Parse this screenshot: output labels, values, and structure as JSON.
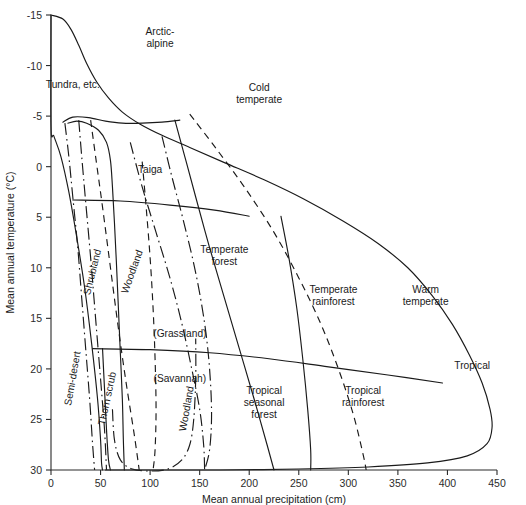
{
  "figure": {
    "line_color": "#1a1a1a",
    "background": "#ffffff"
  },
  "chart_data": {
    "type": "line",
    "title": "",
    "xlabel": "Mean annual precipitation (cm)",
    "ylabel": "Mean annual temperature (°C)",
    "xlim": [
      0,
      450
    ],
    "ylim_top": -15,
    "ylim_bottom": 30,
    "y_inverted": true,
    "grid": false,
    "legend": "none",
    "xticks": [
      0,
      50,
      100,
      150,
      200,
      250,
      300,
      350,
      400,
      450
    ],
    "xticklabels": [
      "0",
      "50",
      "100",
      "150",
      "200",
      "250",
      "300",
      "350",
      "400",
      "450"
    ],
    "yticks": [
      -15,
      -10,
      -5,
      0,
      5,
      10,
      15,
      20,
      25,
      30
    ],
    "yticklabels": [
      "-15",
      "-10",
      "-5",
      "0",
      "5",
      "10",
      "15",
      "20",
      "25",
      "30"
    ],
    "annotations": [
      {
        "text": "Arctic-alpine",
        "x": 110,
        "y": -13.0
      },
      {
        "text": "Tundra, etc.",
        "x": 22,
        "y": -7.8
      },
      {
        "text": "Taiga",
        "x": 100,
        "y": 0.6
      },
      {
        "text": "Cold temperate",
        "x": 210,
        "y": -7.5
      },
      {
        "text": "Shrubland",
        "x": 45,
        "y": 10.5,
        "rotation": -76
      },
      {
        "text": "Woodland",
        "x": 85,
        "y": 10.5,
        "rotation": -70
      },
      {
        "text": "Temperate forest",
        "x": 175,
        "y": 8.5
      },
      {
        "text": "(Grassland)",
        "x": 130,
        "y": 16.8
      },
      {
        "text": "(Savannah)",
        "x": 130,
        "y": 21.3
      },
      {
        "text": "Semi-desert",
        "x": 25,
        "y": 21.0,
        "rotation": -80
      },
      {
        "text": "Thorn scrub",
        "x": 60,
        "y": 23.0,
        "rotation": -78
      },
      {
        "text": "Woodland",
        "x": 140,
        "y": 24.0,
        "rotation": -80
      },
      {
        "text": "Temperate rainforest",
        "x": 285,
        "y": 12.5
      },
      {
        "text": "Warm temperate",
        "x": 378,
        "y": 12.5
      },
      {
        "text": "Tropical seasonal forest",
        "x": 215,
        "y": 22.5
      },
      {
        "text": "Tropical rainforest",
        "x": 315,
        "y": 22.5
      },
      {
        "text": "Tropical",
        "x": 425,
        "y": 20.0
      }
    ],
    "series": [
      {
        "name": "outer-envelope",
        "style": "solid",
        "points": [
          [
            0,
            -15
          ],
          [
            12,
            -14.6
          ],
          [
            20,
            -13.6
          ],
          [
            28,
            -12.0
          ],
          [
            36,
            -10.2
          ],
          [
            46,
            -8.4
          ],
          [
            58,
            -6.8
          ],
          [
            72,
            -5.4
          ],
          [
            90,
            -4.2
          ],
          [
            112,
            -3.1
          ],
          [
            140,
            -1.9
          ],
          [
            175,
            -0.4
          ],
          [
            215,
            1.3
          ],
          [
            255,
            3.2
          ],
          [
            295,
            5.4
          ],
          [
            330,
            7.6
          ],
          [
            360,
            10.0
          ],
          [
            385,
            12.8
          ],
          [
            405,
            15.6
          ],
          [
            422,
            18.6
          ],
          [
            435,
            21.4
          ],
          [
            443,
            24.0
          ],
          [
            445,
            25.8
          ],
          [
            440,
            27.4
          ],
          [
            420,
            28.6
          ],
          [
            380,
            29.3
          ],
          [
            320,
            29.7
          ],
          [
            250,
            29.9
          ],
          [
            170,
            30.0
          ],
          [
            110,
            30.0
          ],
          [
            75,
            30.0
          ],
          [
            55,
            30.0
          ]
        ]
      },
      {
        "name": "left-boundary",
        "style": "solid",
        "points": [
          [
            0,
            -15
          ],
          [
            0,
            -4.0
          ],
          [
            3,
            -3.0
          ],
          [
            10,
            -1.0
          ],
          [
            18,
            2.5
          ],
          [
            26,
            7.0
          ],
          [
            34,
            12.0
          ],
          [
            41,
            17.5
          ],
          [
            47,
            23.0
          ],
          [
            50,
            27.0
          ],
          [
            51,
            29.3
          ],
          [
            52,
            30.0
          ]
        ]
      },
      {
        "name": "tundra-inner-solid",
        "style": "solid",
        "points": [
          [
            17,
            -4.3
          ],
          [
            26,
            -4.5
          ],
          [
            36,
            -4.3
          ],
          [
            48,
            -3.6
          ],
          [
            56,
            -2.4
          ],
          [
            60,
            -0.6
          ],
          [
            62,
            2.0
          ],
          [
            64,
            5.5
          ],
          [
            66,
            9.5
          ],
          [
            68,
            14.0
          ],
          [
            70,
            18.5
          ],
          [
            72,
            23.0
          ],
          [
            73,
            27.0
          ],
          [
            74,
            30.0
          ]
        ]
      },
      {
        "name": "tundra-cap-upper",
        "style": "solid",
        "points": [
          [
            12,
            -4.4
          ],
          [
            22,
            -4.9
          ],
          [
            38,
            -4.85
          ],
          [
            55,
            -4.5
          ],
          [
            72,
            -4.3
          ],
          [
            92,
            -4.3
          ],
          [
            112,
            -4.4
          ],
          [
            130,
            -4.6
          ]
        ]
      },
      {
        "name": "tundra-dashdot-a",
        "style": "dashdot",
        "points": [
          [
            14,
            -4.3
          ],
          [
            18,
            -1.0
          ],
          [
            22,
            3.0
          ],
          [
            27,
            8.0
          ],
          [
            31,
            13.0
          ],
          [
            35,
            18.0
          ],
          [
            39,
            23.0
          ],
          [
            42,
            27.5
          ],
          [
            44,
            30.0
          ]
        ]
      },
      {
        "name": "tundra-dashdot-b",
        "style": "dashdot",
        "points": [
          [
            28,
            -4.6
          ],
          [
            31,
            -1.0
          ],
          [
            35,
            3.5
          ],
          [
            40,
            9.0
          ],
          [
            45,
            15.0
          ],
          [
            50,
            21.0
          ],
          [
            54,
            26.0
          ],
          [
            56,
            30.0
          ]
        ]
      },
      {
        "name": "boreal-dashed-inner",
        "style": "dashed",
        "points": [
          [
            40,
            -4.6
          ],
          [
            45,
            -1.0
          ],
          [
            52,
            4.0
          ],
          [
            60,
            10.0
          ],
          [
            68,
            16.0
          ],
          [
            76,
            21.5
          ],
          [
            84,
            26.5
          ],
          [
            89,
            30.0
          ]
        ]
      },
      {
        "name": "taiga-right-solid",
        "style": "solid",
        "points": [
          [
            125,
            -4.6
          ],
          [
            135,
            -1.0
          ],
          [
            146,
            3.0
          ],
          [
            160,
            8.0
          ],
          [
            175,
            13.0
          ],
          [
            190,
            18.0
          ],
          [
            205,
            23.0
          ],
          [
            218,
            27.5
          ],
          [
            225,
            30.0
          ]
        ]
      },
      {
        "name": "taiga-dashed-outer",
        "style": "dashed",
        "points": [
          [
            140,
            -5.2
          ],
          [
            165,
            -2.0
          ],
          [
            195,
            2.0
          ],
          [
            225,
            6.5
          ],
          [
            250,
            11.0
          ],
          [
            272,
            15.5
          ],
          [
            290,
            20.0
          ],
          [
            305,
            24.5
          ],
          [
            315,
            28.5
          ],
          [
            318,
            30.0
          ]
        ]
      },
      {
        "name": "woodland-dashdot",
        "style": "dashdot",
        "points": [
          [
            80,
            -2.4
          ],
          [
            92,
            2.0
          ],
          [
            106,
            6.5
          ],
          [
            120,
            11.0
          ],
          [
            132,
            15.5
          ],
          [
            142,
            20.0
          ],
          [
            150,
            24.0
          ],
          [
            154,
            27.5
          ],
          [
            155,
            30.0
          ]
        ]
      },
      {
        "name": "temperate-forest-dashdot",
        "style": "dashdot",
        "points": [
          [
            112,
            -3.0
          ],
          [
            122,
            1.0
          ],
          [
            134,
            5.5
          ],
          [
            146,
            10.5
          ],
          [
            155,
            15.5
          ],
          [
            160,
            20.0
          ],
          [
            162,
            24.5
          ],
          [
            160,
            28.0
          ],
          [
            155,
            30.0
          ]
        ]
      },
      {
        "name": "horizontal-divider-cool",
        "style": "solid",
        "points": [
          [
            22,
            3.3
          ],
          [
            70,
            3.4
          ],
          [
            120,
            3.8
          ],
          [
            165,
            4.3
          ],
          [
            200,
            4.9
          ]
        ]
      },
      {
        "name": "horizontal-divider-warm",
        "style": "solid",
        "points": [
          [
            42,
            18.0
          ],
          [
            100,
            18.1
          ],
          [
            160,
            18.4
          ],
          [
            220,
            19.0
          ],
          [
            280,
            19.8
          ],
          [
            340,
            20.6
          ],
          [
            395,
            21.4
          ]
        ]
      },
      {
        "name": "tropical-seasonal-right",
        "style": "solid",
        "points": [
          [
            232,
            4.9
          ],
          [
            240,
            9.0
          ],
          [
            248,
            14.0
          ],
          [
            254,
            19.0
          ],
          [
            259,
            24.0
          ],
          [
            262,
            28.0
          ],
          [
            262,
            30.0
          ]
        ]
      },
      {
        "name": "savannah-dashed",
        "style": "dashed",
        "points": [
          [
            92,
            -0.5
          ],
          [
            96,
            4.0
          ],
          [
            100,
            9.0
          ],
          [
            103,
            14.0
          ],
          [
            105,
            19.0
          ],
          [
            106,
            24.0
          ],
          [
            105,
            28.0
          ],
          [
            103,
            30.0
          ]
        ]
      },
      {
        "name": "lower-arc-dashdot",
        "style": "dashdot",
        "points": [
          [
            62,
            24.0
          ],
          [
            64,
            27.0
          ],
          [
            70,
            29.0
          ],
          [
            82,
            29.9
          ],
          [
            100,
            30.1
          ],
          [
            118,
            29.9
          ],
          [
            132,
            29.0
          ],
          [
            140,
            27.5
          ],
          [
            144,
            25.0
          ],
          [
            146,
            21.0
          ],
          [
            146,
            17.0
          ]
        ]
      },
      {
        "name": "thorn-scrub-solid",
        "style": "solid",
        "points": [
          [
            52,
            18.0
          ],
          [
            54,
            22.0
          ],
          [
            56,
            26.0
          ],
          [
            58,
            29.0
          ],
          [
            60,
            30.0
          ]
        ]
      }
    ]
  },
  "axes": {
    "x_title": "Mean annual precipitation (cm)",
    "y_title": "Mean annual temperature (°C)"
  }
}
